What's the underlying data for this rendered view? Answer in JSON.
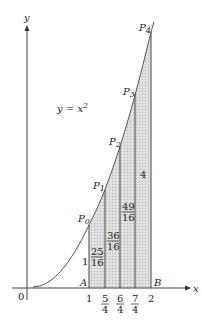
{
  "diagram": {
    "curve_label": "y = x",
    "curve_exponent": "2",
    "axis_x_label": "x",
    "axis_y_label": "y",
    "origin_label": "0",
    "point_A": "A",
    "point_B": "B",
    "points": [
      {
        "name": "P",
        "sub": "0"
      },
      {
        "name": "P",
        "sub": "1"
      },
      {
        "name": "P",
        "sub": "2"
      },
      {
        "name": "P",
        "sub": "3"
      },
      {
        "name": "P",
        "sub": "4"
      }
    ],
    "x_ticks": [
      {
        "num": "1",
        "den": ""
      },
      {
        "num": "5",
        "den": "4"
      },
      {
        "num": "6",
        "den": "4"
      },
      {
        "num": "7",
        "den": "4"
      },
      {
        "num": "2",
        "den": ""
      }
    ],
    "height_labels": [
      {
        "num": "1",
        "den": ""
      },
      {
        "num": "25",
        "den": "16"
      },
      {
        "num": "36",
        "den": "16"
      },
      {
        "num": "49",
        "den": "16"
      },
      {
        "num": "4",
        "den": ""
      }
    ],
    "colors": {
      "line": "#444444",
      "shade": "#d4d4d4"
    }
  }
}
